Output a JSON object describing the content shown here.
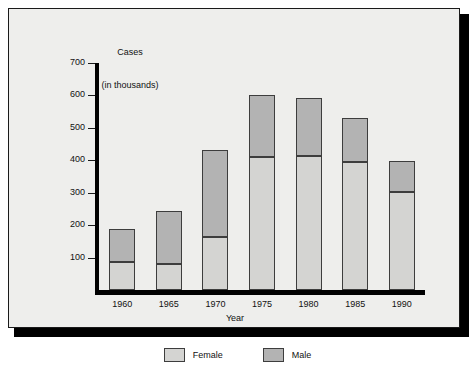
{
  "chart_data": {
    "type": "bar",
    "subtype": "stacked-vertical",
    "title": "",
    "ylabel_line1": "Cases",
    "ylabel_line2": "(in thousands)",
    "xlabel": "Year",
    "categories": [
      "1960",
      "1965",
      "1970",
      "1975",
      "1980",
      "1985",
      "1990"
    ],
    "series": [
      {
        "name": "Female",
        "values": [
          85,
          80,
          165,
          410,
          413,
          395,
          303
        ],
        "color": "#d4d4d2"
      },
      {
        "name": "Male",
        "values": [
          103,
          165,
          267,
          190,
          179,
          135,
          94
        ],
        "color": "#b3b3b3"
      }
    ],
    "stacked_totals": [
      188,
      245,
      432,
      600,
      592,
      530,
      397
    ],
    "ylim": [
      0,
      700
    ],
    "ytick_labels": [
      "700",
      "600",
      "500",
      "400",
      "300",
      "200",
      "100"
    ],
    "ytick_values": [
      700,
      600,
      500,
      400,
      300,
      200,
      100
    ],
    "grid": false,
    "legend_position": "bottom-center",
    "legend": [
      {
        "label": "Female",
        "color": "#d4d4d2"
      },
      {
        "label": "Male",
        "color": "#b3b3b3"
      }
    ]
  },
  "colors": {
    "panel_background": "#eeeeec",
    "frame_border": "#1a1a1a",
    "axis": "#000000",
    "bar_outline": "#3d3d3d",
    "female_fill": "#d4d4d2",
    "male_fill": "#b3b3b3"
  }
}
